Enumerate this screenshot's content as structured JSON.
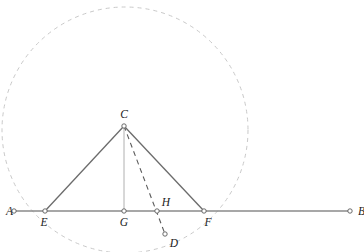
{
  "figure": {
    "width": 364,
    "height": 252,
    "background_color": "#ffffff"
  },
  "styles": {
    "line_color": "#6b6b6b",
    "baseline_color": "#8a8a8a",
    "circle_color": "#c9c9c9",
    "dash_color": "#5a5a5a",
    "altitude_color": "#b0b0b0",
    "marker_stroke": "#5a5a5a",
    "marker_fill": "#ffffff",
    "label_color": "#222222",
    "circle_dash_pattern": "4,4",
    "cevian_dash_pattern": "5,4"
  },
  "geometry": {
    "circle": {
      "name": "circumcircle",
      "cx": 125,
      "cy": 130,
      "r": 123,
      "dashed": true
    },
    "baseline": {
      "name": "line-AB",
      "x1": 14,
      "y1": 211,
      "x2": 350,
      "y2": 211
    },
    "segments": [
      {
        "name": "segment-EC",
        "x1": 45,
        "y1": 211,
        "x2": 124,
        "y2": 126,
        "style": "solid"
      },
      {
        "name": "segment-CF",
        "x1": 124,
        "y1": 126,
        "x2": 204,
        "y2": 211,
        "style": "solid"
      },
      {
        "name": "segment-CG-altitude",
        "x1": 124,
        "y1": 126,
        "x2": 124,
        "y2": 211,
        "style": "solid-light"
      },
      {
        "name": "segment-CD-cevian",
        "x1": 124,
        "y1": 126,
        "x2": 165,
        "y2": 234,
        "style": "dashed"
      }
    ]
  },
  "points": [
    {
      "id": "A",
      "label": "A",
      "x": 14,
      "y": 211,
      "label_x": 6,
      "label_y": 215,
      "label_anchor": "start"
    },
    {
      "id": "E",
      "label": "E",
      "x": 45,
      "y": 211,
      "label_x": 44,
      "label_y": 226,
      "label_anchor": "middle"
    },
    {
      "id": "C",
      "label": "C",
      "x": 124,
      "y": 126,
      "label_x": 124,
      "label_y": 118,
      "label_anchor": "middle"
    },
    {
      "id": "G",
      "label": "G",
      "x": 124,
      "y": 211,
      "label_x": 124,
      "label_y": 226,
      "label_anchor": "middle"
    },
    {
      "id": "H",
      "label": "H",
      "x": 157,
      "y": 211,
      "label_x": 166,
      "label_y": 206,
      "label_anchor": "middle"
    },
    {
      "id": "F",
      "label": "F",
      "x": 204,
      "y": 211,
      "label_x": 208,
      "label_y": 226,
      "label_anchor": "middle"
    },
    {
      "id": "D",
      "label": "D",
      "x": 165,
      "y": 234,
      "label_x": 174,
      "label_y": 247,
      "label_anchor": "middle"
    },
    {
      "id": "B",
      "label": "B",
      "x": 350,
      "y": 211,
      "label_x": 358,
      "label_y": 215,
      "label_anchor": "start"
    }
  ]
}
